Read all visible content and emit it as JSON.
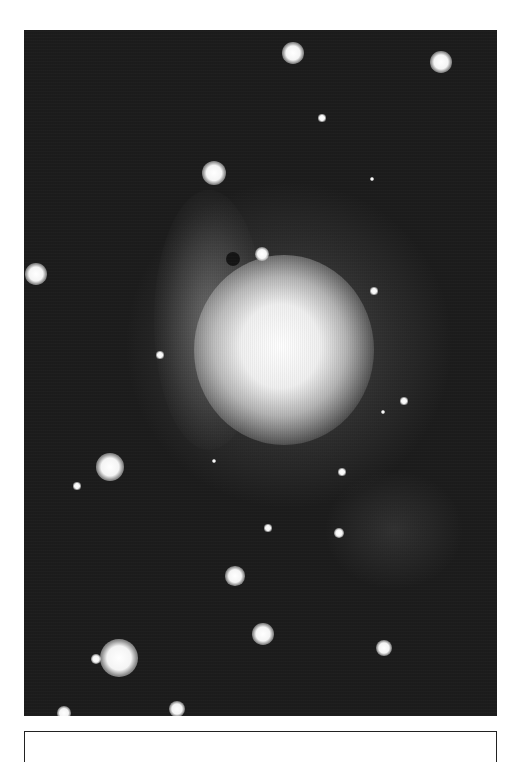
{
  "figure": {
    "background_color": "#1c1c1c",
    "star_color": "#ffffff",
    "caption": ""
  },
  "stars": [
    {
      "x": 293,
      "y": 53,
      "r": 9
    },
    {
      "x": 441,
      "y": 62,
      "r": 9
    },
    {
      "x": 214,
      "y": 173,
      "r": 10
    },
    {
      "x": 36,
      "y": 274,
      "r": 9
    },
    {
      "x": 262,
      "y": 254,
      "r": 6
    },
    {
      "x": 110,
      "y": 467,
      "r": 12
    },
    {
      "x": 235,
      "y": 576,
      "r": 8
    },
    {
      "x": 263,
      "y": 634,
      "r": 9
    },
    {
      "x": 384,
      "y": 648,
      "r": 7
    },
    {
      "x": 119,
      "y": 658,
      "r": 16
    },
    {
      "x": 177,
      "y": 709,
      "r": 7
    },
    {
      "x": 64,
      "y": 713,
      "r": 6
    },
    {
      "x": 322,
      "y": 118,
      "r": 3
    },
    {
      "x": 374,
      "y": 291,
      "r": 3
    },
    {
      "x": 404,
      "y": 401,
      "r": 3
    },
    {
      "x": 342,
      "y": 472,
      "r": 3
    },
    {
      "x": 268,
      "y": 528,
      "r": 3
    },
    {
      "x": 339,
      "y": 533,
      "r": 4
    },
    {
      "x": 77,
      "y": 486,
      "r": 3
    },
    {
      "x": 96,
      "y": 659,
      "r": 4
    },
    {
      "x": 160,
      "y": 355,
      "r": 3
    },
    {
      "x": 383,
      "y": 412,
      "r": 2
    },
    {
      "x": 372,
      "y": 179,
      "r": 2
    },
    {
      "x": 214,
      "y": 461,
      "r": 2
    }
  ]
}
